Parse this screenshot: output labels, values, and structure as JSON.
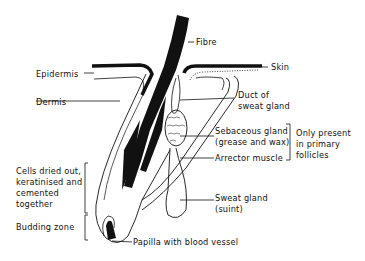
{
  "diagram": {
    "labels": {
      "fibre": "Fibre",
      "skin": "Skin",
      "epidermis": "Epidermis",
      "dermis": "Dermis",
      "duct_line1": "Duct of",
      "duct_line2": "sweat gland",
      "sebaceous_line1": "Sebaceous gland",
      "sebaceous_line2": "(grease and wax)",
      "arrector": "Arrector muscle",
      "primary_line1": "Only present",
      "primary_line2": "in primary",
      "primary_line3": "follicles",
      "cells_line1": "Cells dried out,",
      "cells_line2": "keratinised and",
      "cells_line3": "cemented",
      "cells_line4": "together",
      "budding": "Budding zone",
      "sweat_line1": "Sweat gland",
      "sweat_line2": "(suint)",
      "papilla": "Papilla with blood vessel"
    },
    "colors": {
      "ink": "#111111",
      "paper": "#ffffff"
    }
  }
}
